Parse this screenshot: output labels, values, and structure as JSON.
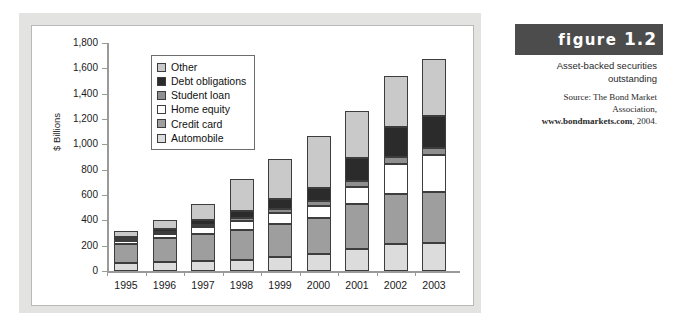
{
  "figure": {
    "label": "figure",
    "number": "1.2",
    "caption": "Asset-backed securities outstanding",
    "source_line1": "Source: The Bond Market",
    "source_line2": "Association,",
    "source_site": "www.bondmarkets.com",
    "source_year": ", 2004."
  },
  "colors": {
    "other": "#c9c9c9",
    "debt_obligations": "#2b2b2b",
    "student_loan": "#8f8f8f",
    "home_equity": "#ffffff",
    "credit_card": "#9e9e9e",
    "automobile": "#dcdcdc",
    "panel": "#e3e3e1",
    "figure_bar": "#4c4c4c",
    "axis": "#9a9a98"
  },
  "chart_data": {
    "type": "bar",
    "stacked": true,
    "title": "Asset-backed securities outstanding",
    "xlabel": "",
    "ylabel": "$ Billions",
    "ylim": [
      0,
      1800
    ],
    "ytick_step": 200,
    "yticks": [
      "1,800",
      "1,600",
      "1,400",
      "1,200",
      "1,000",
      "800",
      "600",
      "400",
      "200",
      "0"
    ],
    "ytick_values": [
      1800,
      1600,
      1400,
      1200,
      1000,
      800,
      600,
      400,
      200,
      0
    ],
    "grid": false,
    "legend_position": "upper-left-inside",
    "categories": [
      "1995",
      "1996",
      "1997",
      "1998",
      "1999",
      "2000",
      "2001",
      "2002",
      "2003"
    ],
    "stack_order_bottom_to_top": [
      "Automobile",
      "Credit card",
      "Home equity",
      "Student loan",
      "Debt obligations",
      "Other"
    ],
    "series": [
      {
        "name": "Automobile",
        "key": "automobile",
        "values": [
          60,
          72,
          80,
          85,
          110,
          135,
          175,
          215,
          220
        ]
      },
      {
        "name": "Credit card",
        "key": "credit_card",
        "values": [
          150,
          188,
          210,
          235,
          258,
          280,
          355,
          390,
          405
        ]
      },
      {
        "name": "Home equity",
        "key": "home_equity",
        "values": [
          30,
          35,
          60,
          75,
          90,
          100,
          135,
          240,
          290
        ]
      },
      {
        "name": "Student loan",
        "key": "student_loan",
        "values": [
          10,
          12,
          15,
          20,
          30,
          35,
          45,
          55,
          55
        ]
      },
      {
        "name": "Debt obligations",
        "key": "debt_obligations",
        "values": [
          16,
          23,
          35,
          55,
          80,
          105,
          185,
          235,
          255
        ]
      },
      {
        "name": "Other",
        "key": "other",
        "values": [
          50,
          70,
          130,
          255,
          317,
          410,
          370,
          405,
          445
        ]
      }
    ],
    "totals": [
      316,
      400,
      530,
      725,
      885,
      1065,
      1265,
      1540,
      1670
    ]
  },
  "legend": {
    "items": [
      {
        "label": "Other",
        "key": "other"
      },
      {
        "label": "Debt obligations",
        "key": "debt_obligations"
      },
      {
        "label": "Student loan",
        "key": "student_loan"
      },
      {
        "label": "Home equity",
        "key": "home_equity"
      },
      {
        "label": "Credit card",
        "key": "credit_card"
      },
      {
        "label": "Automobile",
        "key": "automobile"
      }
    ]
  }
}
